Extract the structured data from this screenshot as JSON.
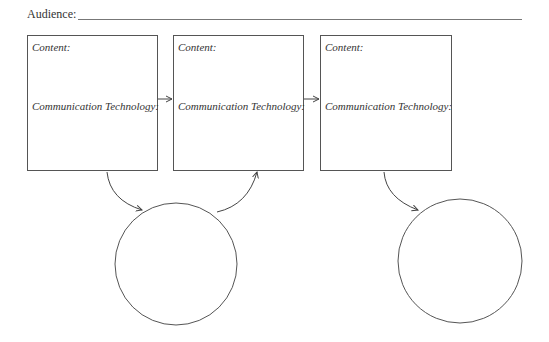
{
  "header": {
    "audience_label": "Audience:"
  },
  "boxes": [
    {
      "content_label": "Content:",
      "technology_label": "Communication Technology:"
    },
    {
      "content_label": "Content:",
      "technology_label": "Communication Technology:"
    },
    {
      "content_label": "Content:",
      "technology_label": "Communication Technology:"
    }
  ],
  "circles": [
    {
      "label": ""
    },
    {
      "label": ""
    }
  ],
  "colors": {
    "line": "#555555",
    "text": "#333333",
    "background": "#ffffff"
  }
}
